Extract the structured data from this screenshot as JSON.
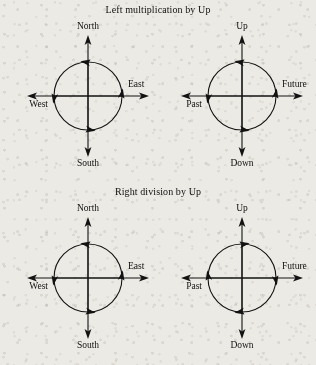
{
  "figure": {
    "background_color": "#eceae4",
    "ink_color": "#121212"
  },
  "panels": [
    {
      "title": "Left multiplication by Up",
      "diagrams": [
        {
          "name": "spatial-axes",
          "rotation": "counterclockwise",
          "labels": {
            "up": "North",
            "right": "East",
            "down": "South",
            "left": "West"
          }
        },
        {
          "name": "temporal-axes",
          "rotation": "counterclockwise",
          "labels": {
            "up": "Up",
            "right": "Future",
            "down": "Down",
            "left": "Past"
          }
        }
      ]
    },
    {
      "title": "Right division by Up",
      "diagrams": [
        {
          "name": "spatial-axes",
          "rotation": "counterclockwise",
          "labels": {
            "up": "North",
            "right": "East",
            "down": "South",
            "left": "West"
          }
        },
        {
          "name": "temporal-axes",
          "rotation": "clockwise",
          "labels": {
            "up": "Up",
            "right": "Future",
            "down": "Down",
            "left": "Past"
          }
        }
      ]
    }
  ]
}
